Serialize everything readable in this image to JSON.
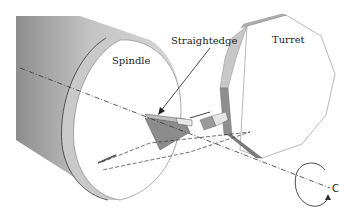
{
  "diagram": {
    "labels": {
      "spindle": "Spindle",
      "straightedge": "Straightedge",
      "turret": "Turret",
      "rotation_axis": "C"
    },
    "components": [
      {
        "id": "spindle",
        "shape": "cylinder",
        "fill": "#b5b5b5"
      },
      {
        "id": "straightedge",
        "shape": "prism-bar",
        "fill": "#8f8f8f"
      },
      {
        "id": "turret",
        "shape": "polygon",
        "fill": "#ffffff",
        "edge_fill": "#bdbdbd"
      },
      {
        "id": "tool-holder",
        "shape": "block",
        "fill": "#9a9a9a"
      },
      {
        "id": "c-axis-rotation",
        "shape": "circular-arrow"
      }
    ],
    "colors": {
      "line": "#333333",
      "spindle_dark": "#8a8a8a",
      "spindle_light": "#d9d9d9",
      "face": "#ffffff"
    }
  }
}
